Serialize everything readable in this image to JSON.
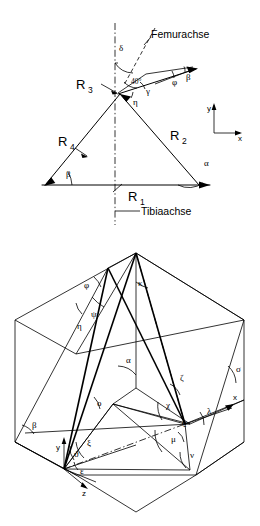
{
  "figure": {
    "language": "de",
    "panels": [
      {
        "id": "top",
        "name": "force-vector-panel",
        "description": "Ebenes Kraftvektordiagramm am Kniegelenk mit Femurachse und Tibiaachse",
        "axis_labels": {
          "x": "x",
          "y": "y"
        },
        "reference_lines": [
          {
            "name": "Femurachse",
            "label": "Femurachse",
            "style": "dashed"
          },
          {
            "name": "Tibiaachse",
            "label": "Tibiaachse",
            "style": "dash-dot"
          }
        ],
        "vectors": [
          {
            "name": "R1",
            "base": "R",
            "index": "1"
          },
          {
            "name": "R2",
            "base": "R",
            "index": "2"
          },
          {
            "name": "R3",
            "base": "R",
            "index": "3"
          },
          {
            "name": "R4",
            "base": "R",
            "index": "4"
          }
        ],
        "angles": [
          {
            "name": "delta",
            "label": "δ"
          },
          {
            "name": "forty",
            "label": "40°"
          },
          {
            "name": "gamma",
            "label": "γ"
          },
          {
            "name": "eta",
            "label": "η"
          },
          {
            "name": "phi",
            "label": "φ"
          },
          {
            "name": "beta-upper",
            "label": "β"
          },
          {
            "name": "beta-lower",
            "label": "β"
          },
          {
            "name": "alpha",
            "label": "α"
          }
        ]
      },
      {
        "id": "bottom",
        "name": "spatial-angle-panel",
        "description": "Räumliches Diagramm mit Winkelbezeichnungen im xyz-Koordinatensystem",
        "axis_labels": {
          "x": "x",
          "y": "y",
          "z": "z"
        },
        "angles": [
          {
            "name": "phi",
            "label": "φ"
          },
          {
            "name": "psi",
            "label": "ψ"
          },
          {
            "name": "eta",
            "label": "η"
          },
          {
            "name": "kappa",
            "label": "κ"
          },
          {
            "name": "alpha",
            "label": "α"
          },
          {
            "name": "beta",
            "label": "β"
          },
          {
            "name": "sigma",
            "label": "σ"
          },
          {
            "name": "omicron",
            "label": "ο"
          },
          {
            "name": "zeta",
            "label": "ζ"
          },
          {
            "name": "chi",
            "label": "χ"
          },
          {
            "name": "lambda",
            "label": "λ"
          },
          {
            "name": "rho",
            "label": "ϱ"
          },
          {
            "name": "mu",
            "label": "μ"
          },
          {
            "name": "nu",
            "label": "ν"
          },
          {
            "name": "xi",
            "label": "ξ"
          },
          {
            "name": "theta",
            "label": "ϑ"
          },
          {
            "name": "epsilon",
            "label": "ε"
          }
        ]
      }
    ],
    "colors": {
      "ink": "#000000",
      "paper": "#ffffff"
    }
  }
}
